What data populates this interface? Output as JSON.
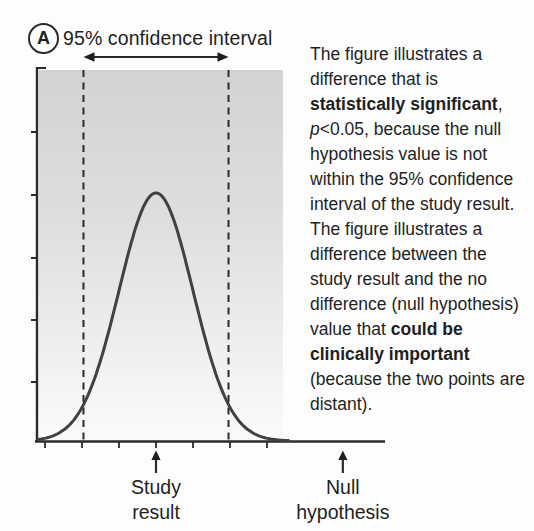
{
  "panel": {
    "label": "A"
  },
  "ci_title": "95% confidence interval",
  "labels": {
    "study": {
      "line1": "Study",
      "line2": "result"
    },
    "null": {
      "line1": "Null",
      "line2": "hypothesis"
    }
  },
  "paragraph": {
    "lines": [
      [
        {
          "t": "The figure illustrates a"
        }
      ],
      [
        {
          "t": "difference that is"
        }
      ],
      [
        {
          "t": "statistically significant",
          "b": true
        },
        {
          "t": ","
        }
      ],
      [
        {
          "t": "p",
          "i": true
        },
        {
          "t": "<0.05, because the null"
        }
      ],
      [
        {
          "t": "hypothesis value is not"
        }
      ],
      [
        {
          "t": "within the 95% confidence"
        }
      ],
      [
        {
          "t": "interval of the study result."
        }
      ],
      [
        {
          "t": "The figure illustrates a"
        }
      ],
      [
        {
          "t": "difference between the"
        }
      ],
      [
        {
          "t": "study result and the no"
        }
      ],
      [
        {
          "t": "difference (null hypothesis)"
        }
      ],
      [
        {
          "t": "value that "
        },
        {
          "t": "could be",
          "b": true
        }
      ],
      [
        {
          "t": "clinically important",
          "b": true
        }
      ],
      [
        {
          "t": "(because the two points are"
        }
      ],
      [
        {
          "t": "distant)."
        }
      ]
    ]
  },
  "chart_data": {
    "type": "line",
    "title": "95% confidence interval",
    "panel_label": "A",
    "curve": {
      "shape": "gaussian",
      "center_z": 0,
      "sigma_z": 1,
      "z_range": [
        -3.18,
        3.58
      ],
      "peak_height": 1
    },
    "confidence_interval": {
      "label": "95% confidence interval",
      "lower_z": -1.96,
      "upper_z": 1.96
    },
    "annotations": [
      {
        "label": "Study result",
        "z": 0
      },
      {
        "label": "Null hypothesis",
        "z": 5.05
      }
    ],
    "x_ticks_z": [
      -3,
      -2,
      -1,
      0,
      1,
      2,
      3
    ],
    "xlabel": "",
    "ylabel": "",
    "grid": false,
    "legend": false,
    "colors": {
      "curve": "#414141",
      "axis": "#2b2b2b",
      "ink": "#1f1f1f",
      "plot_bg_top": "#d3d3d3",
      "plot_bg_bottom": "#fbfbfb"
    }
  }
}
